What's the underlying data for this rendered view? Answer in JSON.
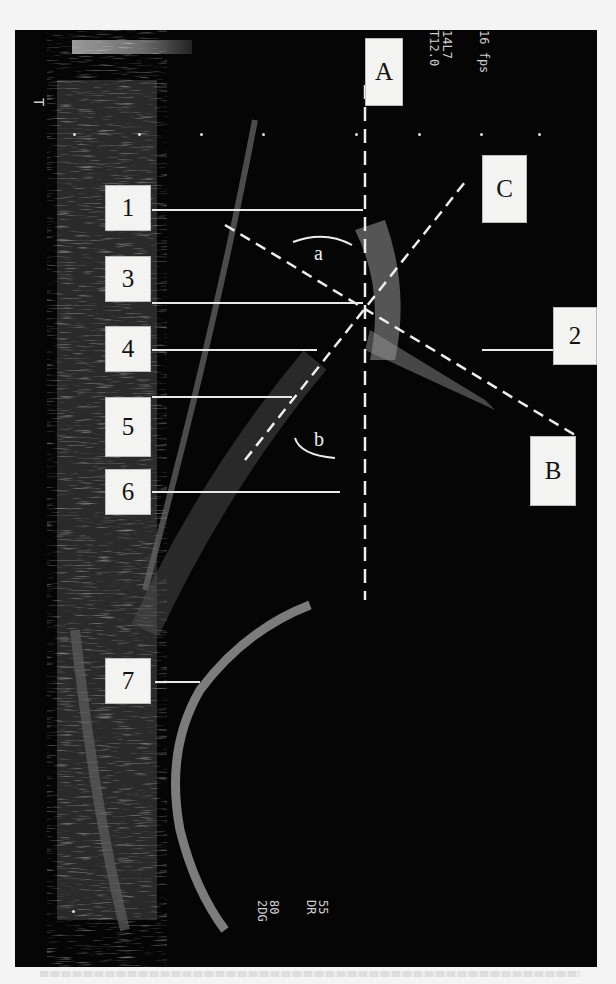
{
  "image": {
    "type": "ultrasound-scan",
    "orientation": "rotated-90",
    "overlay_text": {
      "top_right": [
        "14L7",
        "T12.0",
        "16 fps"
      ],
      "bottom": [
        "2DG",
        "80",
        "DR",
        "55"
      ],
      "top_left_marker": "T"
    },
    "labels": {
      "A": "A",
      "B": "B",
      "C": "C",
      "n1": "1",
      "n2": "2",
      "n3": "3",
      "n4": "4",
      "n5": "5",
      "n6": "6",
      "n7": "7",
      "angle_a": "a",
      "angle_b": "b"
    },
    "colors": {
      "background": "#050505",
      "label_fill": "#f3f3f1",
      "annotation_line": "#e8e8e8"
    }
  }
}
